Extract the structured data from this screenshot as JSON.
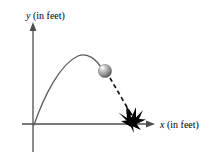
{
  "figure": {
    "name": "projectile-trajectory-diagram",
    "background_color": "#ffffff",
    "width": 210,
    "height": 162
  },
  "axes": {
    "x_axis": {
      "variable": "x",
      "unit_text": "(in feet)",
      "arrow": "right-arrow-icon",
      "color": "#4d4d4d",
      "start_x": 36,
      "end_x": 153,
      "y": 124
    },
    "y_axis": {
      "variable": "y",
      "unit_text": "(in feet)",
      "arrow": "up-arrow-icon",
      "color": "#4d4d4d",
      "x": 33,
      "top_y": 24,
      "bottom_y": 152
    },
    "origin": {
      "x": 33,
      "y": 124
    }
  },
  "trajectory": {
    "solid_arc": {
      "name": "ascending-parabola-path",
      "color": "#555555",
      "stroke_width": 1.2,
      "start": {
        "x": 34,
        "y": 124
      },
      "apex": {
        "x": 82,
        "y": 55
      },
      "end": {
        "x": 101,
        "y": 68
      }
    },
    "dashed_fall": {
      "name": "descending-dashed-path",
      "color": "#111111",
      "stroke_width": 1.6,
      "dash_pattern": "4 3",
      "start": {
        "x": 110,
        "y": 77
      },
      "end": {
        "x": 130,
        "y": 113
      }
    }
  },
  "ball": {
    "name": "projectile-ball",
    "center_x": 105,
    "center_y": 71,
    "radius": 6.5,
    "fill_light": "#e8e8e8",
    "fill_mid": "#9a9a9a",
    "fill_dark": "#5a5a5a",
    "highlight_x": 102,
    "highlight_y": 67
  },
  "impact": {
    "name": "impact-starburst",
    "color": "#000000",
    "center_x": 131,
    "center_y": 122
  },
  "labels": {
    "y_axis_label": {
      "variable": "y",
      "unit": "(in feet)",
      "x": 26,
      "y": 18
    },
    "x_axis_label": {
      "variable": "x",
      "unit": "(in feet)",
      "x": 160,
      "y": 128
    }
  }
}
